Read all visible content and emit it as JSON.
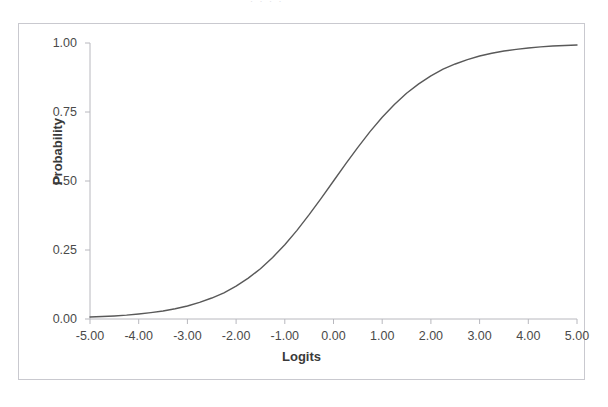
{
  "figure": {
    "scan_artifact_text": "· ·        · ·",
    "frame_color": "#c9c9cf",
    "curve_color": "#595959",
    "axis_color": "#b8b8be",
    "background": "#ffffff"
  },
  "chart_data": {
    "type": "line",
    "title": "",
    "xlabel": "Logits",
    "ylabel": "Probability",
    "xlim": [
      -5,
      5
    ],
    "ylim": [
      0,
      1
    ],
    "grid": false,
    "legend": null,
    "xticks": [
      "-5.00",
      "-4.00",
      "-3.00",
      "-2.00",
      "-1.00",
      "0.00",
      "1.00",
      "2.00",
      "3.00",
      "4.00",
      "5.00"
    ],
    "xtick_values": [
      -5,
      -4,
      -3,
      -2,
      -1,
      0,
      1,
      2,
      3,
      4,
      5
    ],
    "yticks": [
      "0.00",
      "0.25",
      "0.50",
      "0.75",
      "1.00"
    ],
    "ytick_values": [
      0,
      0.25,
      0.5,
      0.75,
      1
    ],
    "series": [
      {
        "name": "Logistic (ogive) function",
        "x": [
          -5,
          -4.75,
          -4.5,
          -4.25,
          -4,
          -3.75,
          -3.5,
          -3.25,
          -3,
          -2.75,
          -2.5,
          -2.25,
          -2,
          -1.75,
          -1.5,
          -1.25,
          -1,
          -0.75,
          -0.5,
          -0.25,
          0,
          0.25,
          0.5,
          0.75,
          1,
          1.25,
          1.5,
          1.75,
          2,
          2.25,
          2.5,
          2.75,
          3,
          3.25,
          3.5,
          3.75,
          4,
          4.25,
          4.5,
          4.75,
          5
        ],
        "y": [
          0.007,
          0.009,
          0.011,
          0.014,
          0.018,
          0.023,
          0.029,
          0.037,
          0.047,
          0.06,
          0.076,
          0.095,
          0.119,
          0.148,
          0.182,
          0.223,
          0.269,
          0.321,
          0.378,
          0.438,
          0.5,
          0.562,
          0.622,
          0.679,
          0.731,
          0.777,
          0.818,
          0.852,
          0.881,
          0.905,
          0.924,
          0.94,
          0.953,
          0.963,
          0.971,
          0.977,
          0.982,
          0.986,
          0.989,
          0.991,
          0.993
        ]
      }
    ]
  }
}
